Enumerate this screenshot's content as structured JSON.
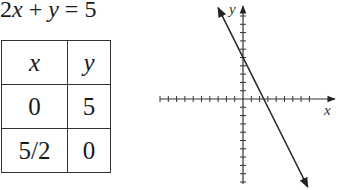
{
  "equation": {
    "text": "2x + y = 5",
    "parts": [
      "2",
      "x",
      " + ",
      "y",
      " = 5"
    ]
  },
  "table": {
    "headers": [
      "x",
      "y"
    ],
    "rows": [
      [
        "0",
        "5"
      ],
      [
        "5/2",
        "0"
      ]
    ]
  },
  "chart_data": {
    "type": "line",
    "title": "2x + y = 5",
    "xlabel": "x",
    "ylabel": "y",
    "xlim": [
      -10,
      8
    ],
    "ylim": [
      -10,
      10
    ],
    "grid": false,
    "tick_step": 1,
    "tick_labels": false,
    "series": [
      {
        "name": "2x + y = 5",
        "equation": "y = -2x + 5",
        "points": [
          [
            0,
            5
          ],
          [
            2.5,
            0
          ]
        ],
        "arrows_both_ends": true,
        "color": "#222222"
      }
    ]
  }
}
